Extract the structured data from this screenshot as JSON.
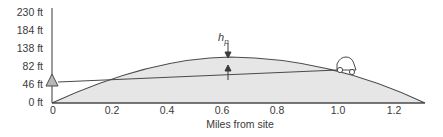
{
  "figure": {
    "x_axis_title": "Miles from site",
    "height_label": "h",
    "height_label_subscript": "p",
    "y_ticks": [
      {
        "label": "230 ft",
        "y": 13
      },
      {
        "label": "184 ft",
        "y": 31
      },
      {
        "label": "138 ft",
        "y": 49
      },
      {
        "label": "82 ft",
        "y": 67
      },
      {
        "label": "46 ft",
        "y": 85
      },
      {
        "label": "0 ft",
        "y": 103
      }
    ],
    "x_ticks": [
      {
        "label": "0",
        "x": 53
      },
      {
        "label": "0.2",
        "x": 112
      },
      {
        "label": "0.4",
        "x": 167
      },
      {
        "label": "0.6",
        "x": 222
      },
      {
        "label": "0.8",
        "x": 277
      },
      {
        "label": "1.0",
        "x": 338
      },
      {
        "label": "1.2",
        "x": 394
      }
    ],
    "elements": {
      "observer": "triangle-marker",
      "target": "car-icon",
      "terrain": "earth-bulge-curve",
      "sightline": "line-of-sight"
    },
    "colors": {
      "line": "#4a4a4a",
      "fill": "#e6e6e6",
      "marker_fill": "#b8b8b8"
    }
  }
}
